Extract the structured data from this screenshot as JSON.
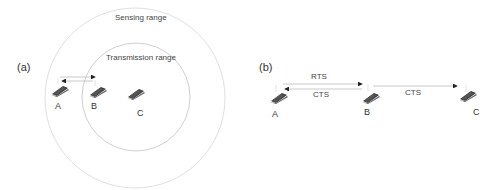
{
  "panel_a": {
    "label": "(a)",
    "sensing_range_label": "Sensing range",
    "transmission_range_label": "Transmission range",
    "nodes": [
      "A",
      "B",
      "C"
    ]
  },
  "panel_b": {
    "label": "(b)",
    "messages": [
      "RTS",
      "CTS",
      "CTS"
    ],
    "nodes": [
      "A",
      "B",
      "C"
    ]
  },
  "colors": {
    "circle": "#d9d9d9",
    "arrow": "#bbbbbb",
    "laptop": "#333333"
  }
}
